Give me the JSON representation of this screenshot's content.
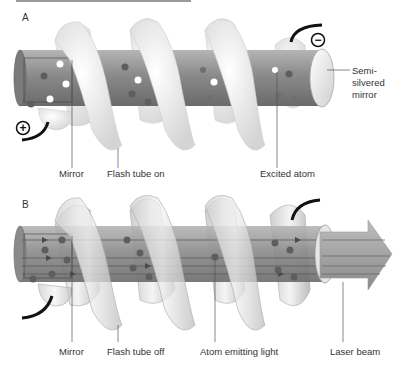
{
  "panels": [
    {
      "id": "A",
      "title": "A",
      "labels": {
        "mirror": "Mirror",
        "flash_tube": "Flash tube on",
        "excited_atom": "Excited atom",
        "semi_mirror_line1": "Semi-",
        "semi_mirror_line2": "silvered",
        "semi_mirror_line3": "mirror"
      },
      "terminals": {
        "positive": "+",
        "negative": "−"
      }
    },
    {
      "id": "B",
      "title": "B",
      "labels": {
        "mirror": "Mirror",
        "flash_tube": "Flash tube off",
        "atom_emitting": "Atom emitting light",
        "laser_beam": "Laser beam"
      }
    }
  ],
  "colors": {
    "rod": "#8c8c8c",
    "rod_dark": "#6e6e6e",
    "flash_tube_on": "#f2f2f2",
    "flash_tube_off": "#d9d9d9",
    "atom": "#5e5e5e",
    "excited_atom": "#ffffff",
    "beam": "#9a9a9a"
  }
}
